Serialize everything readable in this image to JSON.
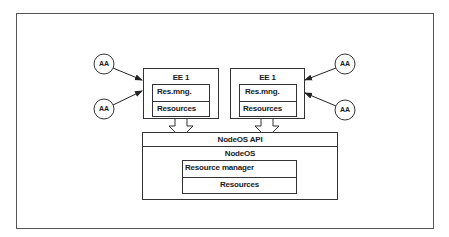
{
  "diagram": {
    "agents": [
      {
        "id": "aa-left-top",
        "label": "AA"
      },
      {
        "id": "aa-left-bottom",
        "label": "AA"
      },
      {
        "id": "aa-right-top",
        "label": "AA"
      },
      {
        "id": "aa-right-bottom",
        "label": "AA"
      }
    ],
    "execution_environments": [
      {
        "title": "EE 1",
        "rows": [
          "Res.mng.",
          "Resources"
        ]
      },
      {
        "title": "EE 1",
        "rows": [
          "Res.mng.",
          "Resources"
        ]
      }
    ],
    "nodeos": {
      "api_label": "NodeOS API",
      "title": "NodeOS",
      "rows": [
        "Resource manager",
        "Resources"
      ]
    }
  }
}
